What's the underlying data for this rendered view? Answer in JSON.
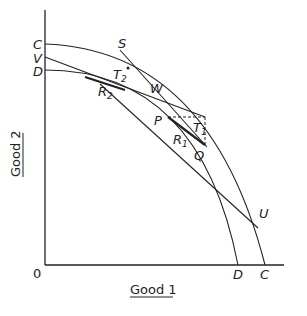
{
  "diagram": {
    "axes": {
      "origin_label": "0",
      "x_label": "Good 1",
      "y_label": "Good 2"
    },
    "curves": {
      "outer_ppf": {
        "y_intercept_label": "C",
        "x_intercept_label": "C"
      },
      "inner_ppf": {
        "y_intercept_label": "D",
        "x_intercept_label": "D"
      }
    },
    "points": {
      "V": "V",
      "S": "S",
      "T2": {
        "main": "T",
        "sub": "2"
      },
      "R2": {
        "main": "R",
        "sub": "2"
      },
      "W": "W",
      "P": "P",
      "T1": {
        "main": "T",
        "sub": "1"
      },
      "R1": {
        "main": "R",
        "sub": "1"
      },
      "Q": "Q",
      "U": "U"
    },
    "colors": {
      "ink": "#222222",
      "background": "#ffffff"
    }
  }
}
